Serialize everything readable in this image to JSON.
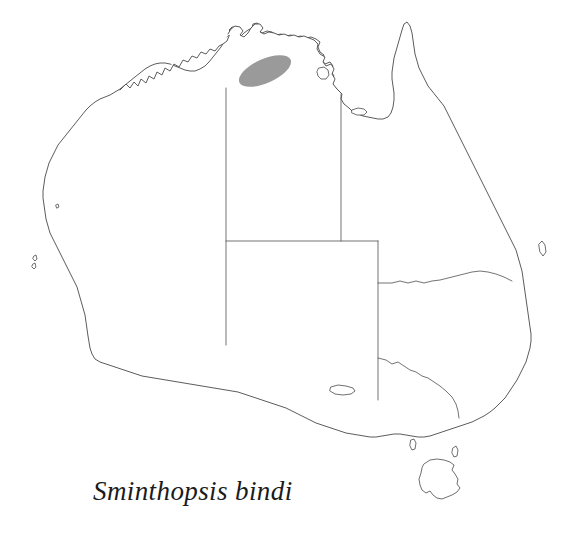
{
  "figure": {
    "kind": "species-distribution-map",
    "region": "Australia",
    "background_color": "#ffffff",
    "outline_color": "#4a4a4a",
    "border_color": "#5a5a5a"
  },
  "caption": {
    "text": "Sminthopsis bindi",
    "style": "italic",
    "x": 93,
    "y": 500
  },
  "distribution": {
    "label": "range-shading",
    "shape": "ellipse",
    "fill_color": "#9a9a9a",
    "center_x": 265,
    "center_y": 71,
    "radius_x": 28,
    "radius_y": 12,
    "rotation_deg": -24,
    "region_name": "Top End, Northern Territory"
  },
  "states": [
    {
      "name": "Western Australia",
      "abbr": "WA"
    },
    {
      "name": "Northern Territory",
      "abbr": "NT"
    },
    {
      "name": "South Australia",
      "abbr": "SA"
    },
    {
      "name": "Queensland",
      "abbr": "QLD"
    },
    {
      "name": "New South Wales",
      "abbr": "NSW"
    },
    {
      "name": "Victoria",
      "abbr": "VIC"
    },
    {
      "name": "Tasmania",
      "abbr": "TAS"
    }
  ],
  "islands": [
    {
      "name": "Tasmania"
    },
    {
      "name": "Groote Eylandt"
    },
    {
      "name": "Kangaroo Island"
    },
    {
      "name": "Mornington Island"
    },
    {
      "name": "King Island"
    },
    {
      "name": "Dirk Hartog Island"
    },
    {
      "name": "Fraser Island"
    },
    {
      "name": "Bathurst Island"
    }
  ]
}
